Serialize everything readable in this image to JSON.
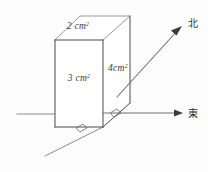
{
  "figure": {
    "background_color": "#fdfdfd",
    "line_color": "#4a4a4a",
    "labels": {
      "top_face": {
        "value": "2",
        "unit": "cm",
        "exponent": "2",
        "full": "2 cm²"
      },
      "front_face": {
        "value": "3",
        "unit": "cm",
        "exponent": "2",
        "full": "3 cm²"
      },
      "right_face": {
        "value": "4",
        "unit": "cm",
        "exponent": "2",
        "full": "4 cm²"
      }
    },
    "directions": {
      "north": {
        "label": "北",
        "meaning": "north"
      },
      "east": {
        "label": "東",
        "meaning": "east"
      }
    }
  }
}
